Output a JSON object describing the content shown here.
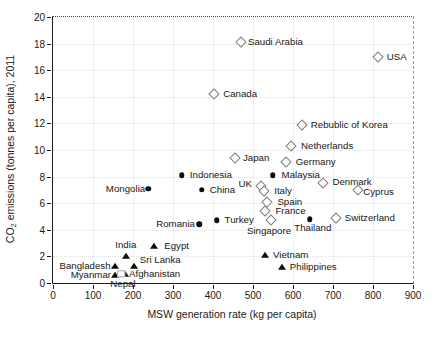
{
  "figure": {
    "ylabel_pre": "CO",
    "ylabel_sub": "2",
    "ylabel_post": " emissions (tonnes per capita), 2011"
  },
  "chart_data": {
    "type": "scatter",
    "title": "",
    "xlabel": "MSW generation rate (kg per capita)",
    "ylabel": "CO2 emissions (tonnes per capita), 2011",
    "xlim": [
      0,
      900
    ],
    "ylim": [
      0,
      20
    ],
    "x_ticks": [
      0,
      100,
      200,
      300,
      400,
      500,
      600,
      700,
      800,
      900
    ],
    "y_ticks": [
      0,
      2,
      4,
      6,
      8,
      10,
      12,
      14,
      16,
      18,
      20
    ],
    "grid": "light-dotted",
    "legend": "none",
    "series": [
      {
        "name": "open-diamond-countries",
        "marker": "diamond",
        "points": [
          {
            "label": "Saudi Arabia",
            "x": 470,
            "y": 18.1,
            "label_pos": "right",
            "dx": -1,
            "dy": 0
          },
          {
            "label": "USA",
            "x": 812,
            "y": 17.0,
            "label_pos": "right",
            "dx": 1,
            "dy": 0
          },
          {
            "label": "Canada",
            "x": 403,
            "y": 14.2,
            "label_pos": "right",
            "dx": 1,
            "dy": 0
          },
          {
            "label": "Rebublic of Korea",
            "x": 622,
            "y": 11.9,
            "label_pos": "right",
            "dx": 1,
            "dy": 0
          },
          {
            "label": "Netherlands",
            "x": 595,
            "y": 10.3,
            "label_pos": "right",
            "dx": 2,
            "dy": 0
          },
          {
            "label": "Japan",
            "x": 455,
            "y": 9.4,
            "label_pos": "right",
            "dx": 0,
            "dy": 0
          },
          {
            "label": "Germany",
            "x": 582,
            "y": 9.1,
            "label_pos": "right",
            "dx": 2,
            "dy": 0
          },
          {
            "label": "UK",
            "x": 520,
            "y": 7.3,
            "label_pos": "left",
            "dx": -4,
            "dy": -2
          },
          {
            "label": "Italy",
            "x": 528,
            "y": 6.9,
            "label_pos": "right",
            "dx": 2,
            "dy": 0
          },
          {
            "label": "Denmark",
            "x": 676,
            "y": 7.5,
            "label_pos": "right",
            "dx": 1,
            "dy": -1
          },
          {
            "label": "Cyprus",
            "x": 763,
            "y": 7.0,
            "label_pos": "right",
            "dx": -3,
            "dy": 2
          },
          {
            "label": "Spain",
            "x": 536,
            "y": 6.1,
            "label_pos": "right",
            "dx": 2,
            "dy": 0
          },
          {
            "label": "France",
            "x": 531,
            "y": 5.4,
            "label_pos": "right",
            "dx": 2,
            "dy": 0
          },
          {
            "label": "Singapore",
            "x": 545,
            "y": 4.7,
            "label_pos": "below",
            "dx": -2,
            "dy": 0
          },
          {
            "label": "Switzerland",
            "x": 707,
            "y": 4.9,
            "label_pos": "right",
            "dx": 1,
            "dy": 0
          }
        ]
      },
      {
        "name": "filled-circle-countries",
        "marker": "circle",
        "points": [
          {
            "label": "Indonesia",
            "x": 322,
            "y": 8.1,
            "label_pos": "right",
            "dx": 0,
            "dy": 0
          },
          {
            "label": "Malaysia",
            "x": 549,
            "y": 8.1,
            "label_pos": "right",
            "dx": 1,
            "dy": 0
          },
          {
            "label": "Mongolia",
            "x": 238,
            "y": 7.1,
            "label_pos": "left",
            "dx": 2,
            "dy": 0
          },
          {
            "label": "China",
            "x": 372,
            "y": 7.0,
            "label_pos": "right",
            "dx": 0,
            "dy": 0
          },
          {
            "label": "Romania",
            "x": 365,
            "y": 4.4,
            "label_pos": "left",
            "dx": 1,
            "dy": 0
          },
          {
            "label": "Turkey",
            "x": 409,
            "y": 4.7,
            "label_pos": "right",
            "dx": 0,
            "dy": 0
          },
          {
            "label": "Thailand",
            "x": 642,
            "y": 4.8,
            "label_pos": "below",
            "dx": 3,
            "dy": -2
          }
        ]
      },
      {
        "name": "filled-triangle-countries",
        "marker": "triangle",
        "points": [
          {
            "label": "India",
            "x": 182,
            "y": 2.0,
            "label_pos": "above",
            "dx": 0,
            "dy": -1
          },
          {
            "label": "Egypt",
            "x": 253,
            "y": 2.8,
            "label_pos": "right",
            "dx": 2,
            "dy": 0
          },
          {
            "label": "Sri Lanka",
            "x": 202,
            "y": 1.25,
            "label_pos": "right",
            "dx": -2,
            "dy": -6
          },
          {
            "label": "Bangladesh",
            "x": 154,
            "y": 1.3,
            "label_pos": "left",
            "dx": 1,
            "dy": 0
          },
          {
            "label": "Myanmar",
            "x": 155,
            "y": 0.6,
            "label_pos": "left",
            "dx": 1,
            "dy": 0
          },
          {
            "label": "Afghanistan",
            "x": 180,
            "y": 0.65,
            "label_pos": "right",
            "dx": -4,
            "dy": 0
          },
          {
            "label": "Vietnam",
            "x": 530,
            "y": 2.1,
            "label_pos": "right",
            "dx": 0,
            "dy": 0
          },
          {
            "label": "Philippines",
            "x": 572,
            "y": 1.2,
            "label_pos": "right",
            "dx": 0,
            "dy": 0
          }
        ]
      },
      {
        "name": "open-square-countries",
        "marker": "square",
        "points": [
          {
            "label": "Nepal",
            "x": 170,
            "y": 0.7,
            "label_pos": "below",
            "dx": 2,
            "dy": -1
          }
        ]
      }
    ]
  }
}
